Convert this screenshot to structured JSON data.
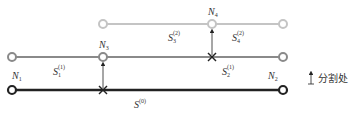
{
  "diagram": {
    "colors": {
      "level0": "#222222",
      "level1": "#8a8a8a",
      "level2": "#c4c4c4",
      "arrow": "#222222"
    },
    "lines": [
      {
        "id": "level2",
        "y": 24,
        "x1": 103,
        "x2": 283,
        "color_key": "level2"
      },
      {
        "id": "level1",
        "y": 57,
        "x1": 12,
        "x2": 283,
        "color_key": "level1"
      },
      {
        "id": "level0",
        "y": 90,
        "x1": 12,
        "x2": 283,
        "color_key": "level0"
      }
    ],
    "nodes": {
      "N1": {
        "base": "N",
        "sub": "1"
      },
      "N2": {
        "base": "N",
        "sub": "2"
      },
      "N3": {
        "base": "N",
        "sub": "3"
      },
      "N4": {
        "base": "N",
        "sub": "4"
      }
    },
    "segments": {
      "S1_1": {
        "base": "S",
        "sub": "1",
        "sup": "(1)"
      },
      "S2_1": {
        "base": "S",
        "sub": "2",
        "sup": "(1)"
      },
      "S3_2": {
        "base": "S",
        "sub": "3",
        "sup": "(2)"
      },
      "S4_2": {
        "base": "S",
        "sub": "4",
        "sup": "(2)"
      },
      "S_0": {
        "base": "S",
        "sub": "",
        "sup": "(0)"
      }
    },
    "legend": {
      "label": "分割处",
      "icon": "split-arrow-icon"
    }
  }
}
